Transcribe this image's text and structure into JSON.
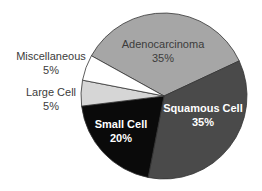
{
  "chart_data": {
    "type": "pie",
    "title": "",
    "categories": [
      "Adenocarcinoma",
      "Squamous Cell",
      "Small Cell",
      "Large Cell",
      "Miscellaneous"
    ],
    "values": [
      35,
      35,
      20,
      5,
      5
    ],
    "labels": [
      "35%",
      "35%",
      "20%",
      "5%",
      "5%"
    ],
    "colors": [
      "#a6a6a6",
      "#4a4a4a",
      "#0a0a0a",
      "#d6d6d6",
      "#ffffff"
    ],
    "legend": "none"
  },
  "slices": [
    {
      "name": "Adenocarcinoma",
      "pct": "35%"
    },
    {
      "name": "Squamous Cell",
      "pct": "35%"
    },
    {
      "name": "Small Cell",
      "pct": "20%"
    },
    {
      "name": "Large Cell",
      "pct": "5%"
    },
    {
      "name": "Miscellaneous",
      "pct": "5%"
    }
  ]
}
